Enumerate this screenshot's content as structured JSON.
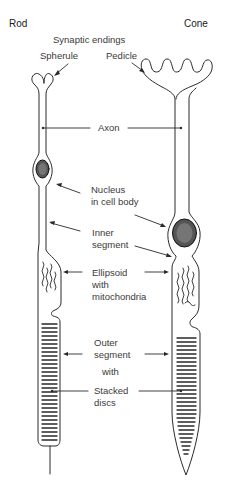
{
  "diagram": {
    "titles": {
      "rod": "Rod",
      "cone": "Cone"
    },
    "labels": {
      "synaptic_endings": "Synaptic endings",
      "spherule": "Spherule",
      "pedicle": "Pedicle",
      "axon": "Axon",
      "nucleus_line1": "Nucleus",
      "nucleus_line2": "in cell body",
      "inner_line1": "Inner",
      "inner_line2": "segment",
      "ellipsoid_line1": "Ellipsoid",
      "ellipsoid_line2": "with",
      "ellipsoid_line3": "mitochondria",
      "outer_line1": "Outer",
      "outer_line2": "segment",
      "with": "with",
      "stacked_line1": "Stacked",
      "stacked_line2": "discs"
    },
    "colors": {
      "line": "#2a2a2a",
      "text": "#3a3a3a",
      "background": "#ffffff"
    }
  }
}
